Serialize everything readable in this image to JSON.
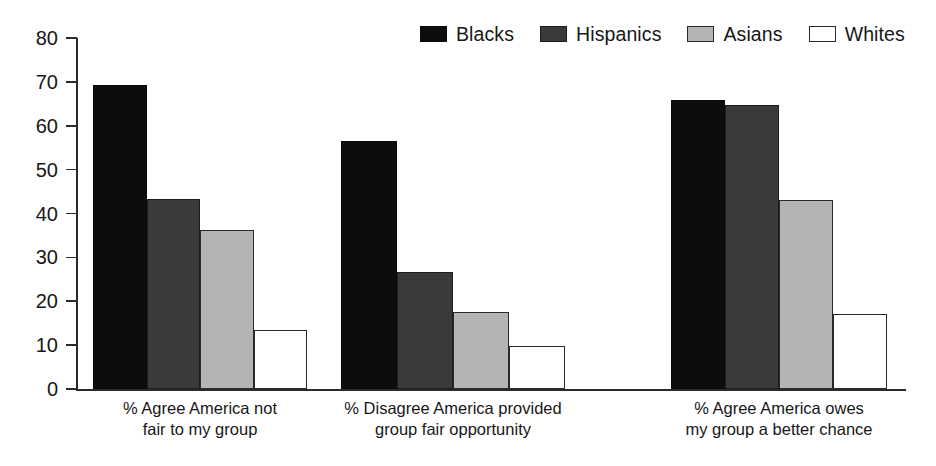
{
  "chart_data": {
    "type": "bar",
    "title": "",
    "subtitle": "",
    "xlabel": "",
    "ylabel": "",
    "ylim": [
      0,
      80
    ],
    "ytick_step": 10,
    "yticks": [
      "80",
      "70",
      "60",
      "50",
      "40",
      "30",
      "20",
      "10",
      "0"
    ],
    "grid": false,
    "legend_position": "top-right",
    "categories": [
      "% Agree America not\nfair to my group",
      "% Disagree America provided\ngroup fair opportunity",
      "% Agree America owes\nmy group a better chance"
    ],
    "series": [
      {
        "name": "Blacks",
        "color": "#0d0d0d",
        "values": [
          69.3,
          56.6,
          65.9
        ]
      },
      {
        "name": "Hispanics",
        "color": "#3a3a3a",
        "values": [
          43.3,
          26.7,
          64.7
        ]
      },
      {
        "name": "Asians",
        "color": "#b4b4b4",
        "values": [
          36.2,
          17.6,
          43.0
        ]
      },
      {
        "name": "Whites",
        "color": "#ffffff",
        "values": [
          13.4,
          9.8,
          17.0
        ]
      }
    ]
  },
  "legend": {
    "items": [
      {
        "label": "Blacks",
        "swatch": "legend-swatch-blacks"
      },
      {
        "label": "Hispanics",
        "swatch": "legend-swatch-hispanics"
      },
      {
        "label": "Asians",
        "swatch": "legend-swatch-asians"
      },
      {
        "label": "Whites",
        "swatch": "legend-swatch-whites"
      }
    ]
  }
}
